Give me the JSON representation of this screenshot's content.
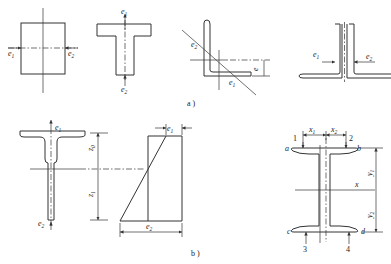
{
  "figure": {
    "captions": {
      "a": "a )",
      "b": "b )"
    },
    "part_a": {
      "rectangle": {
        "labels": [
          "e1",
          "e2"
        ]
      },
      "tee": {
        "labels": [
          "e1",
          "e2"
        ]
      },
      "angle": {
        "labels": [
          "e2",
          "e1",
          "e"
        ]
      },
      "double_angle": {
        "labels": [
          "e1",
          "e2"
        ]
      }
    },
    "part_b": {
      "tee_section": {
        "labels": [
          "e1",
          "e2",
          "z0",
          "z1"
        ]
      },
      "stress_diagram": {
        "labels": [
          "e1",
          "e2"
        ]
      },
      "i_section": {
        "corner_labels": [
          "a",
          "b",
          "c",
          "d"
        ],
        "point_numbers": [
          "1",
          "2",
          "3",
          "4"
        ],
        "dimension_labels": [
          "x1",
          "x2",
          "y1",
          "y2"
        ],
        "axis_label": "x"
      }
    }
  },
  "text": {
    "e": "e",
    "z": "z",
    "x": "x",
    "y": "y",
    "s0": "0",
    "s1": "1",
    "s2": "2",
    "n1": "1",
    "n2": "2",
    "n3": "3",
    "n4": "4",
    "a": "a",
    "b": "b",
    "c": "c",
    "d": "d"
  }
}
